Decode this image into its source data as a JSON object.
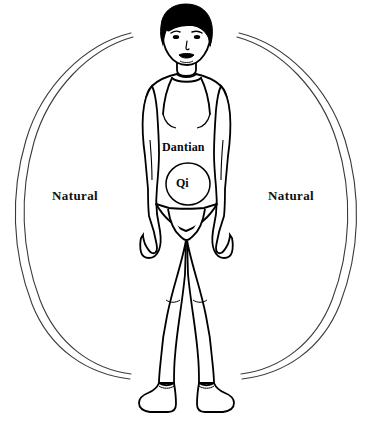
{
  "diagram": {
    "background_color": "#ffffff",
    "line_color": "#000000",
    "arc_color": "#3a3a3a"
  },
  "labels": {
    "natural_left": "Natural",
    "natural_right": "Natural",
    "dantian": "Dantian",
    "qi": "Qi"
  },
  "figure": {
    "name": "standing-human-figure",
    "hair_color": "#000000",
    "outline_color": "#000000"
  },
  "energy_field": {
    "name": "natural-energy-arcs",
    "description": "Two pairs of concentric thin arcs forming an open oval around the figure, left and right",
    "stroke_color": "#3a3a3a",
    "stroke_width": 1
  },
  "dantian_circle": {
    "name": "dantian-qi-circle",
    "center_x": 188,
    "center_y": 184,
    "radius_x": 22,
    "radius_y": 21,
    "stroke_color": "#000000"
  }
}
